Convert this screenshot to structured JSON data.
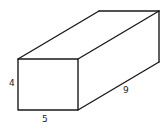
{
  "diagram": {
    "type": "rectangular-prism",
    "labels": {
      "height": "4",
      "width": "5",
      "length": "9"
    },
    "colors": {
      "stroke": "#1a1a1a",
      "background": "#ffffff"
    }
  }
}
